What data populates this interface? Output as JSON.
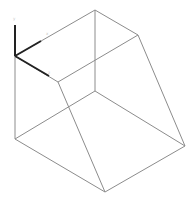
{
  "viewport": {
    "background": "#ffffff",
    "edge_color": "#8c8c8c",
    "axis_color": "#222222"
  },
  "shape": {
    "name": "wedge-prism-wireframe",
    "edges": [
      {
        "x1": 15,
        "y1": 56,
        "x2": 95,
        "y2": 10
      },
      {
        "x1": 95,
        "y1": 10,
        "x2": 138,
        "y2": 35
      },
      {
        "x1": 15,
        "y1": 56,
        "x2": 58,
        "y2": 82
      },
      {
        "x1": 58,
        "y1": 82,
        "x2": 138,
        "y2": 35
      },
      {
        "x1": 58,
        "y1": 82,
        "x2": 105,
        "y2": 192
      },
      {
        "x1": 138,
        "y1": 35,
        "x2": 185,
        "y2": 146
      },
      {
        "x1": 15,
        "y1": 56,
        "x2": 15,
        "y2": 139
      },
      {
        "x1": 15,
        "y1": 139,
        "x2": 105,
        "y2": 192
      },
      {
        "x1": 105,
        "y1": 192,
        "x2": 185,
        "y2": 146
      },
      {
        "x1": 95,
        "y1": 10,
        "x2": 95,
        "y2": 91
      },
      {
        "x1": 95,
        "y1": 91,
        "x2": 15,
        "y2": 139
      },
      {
        "x1": 95,
        "y1": 91,
        "x2": 185,
        "y2": 146
      }
    ]
  },
  "axes": {
    "origin": {
      "x": 15,
      "y": 56
    },
    "y": {
      "x2": 15,
      "y2": 25,
      "label": "y",
      "lx": 13,
      "ly": 20
    },
    "x": {
      "x2": 41,
      "y2": 41,
      "label": "x",
      "lx": 46,
      "ly": 35
    },
    "z": {
      "x2": 49,
      "y2": 76,
      "label": "z",
      "lx": 48,
      "ly": 74
    }
  }
}
